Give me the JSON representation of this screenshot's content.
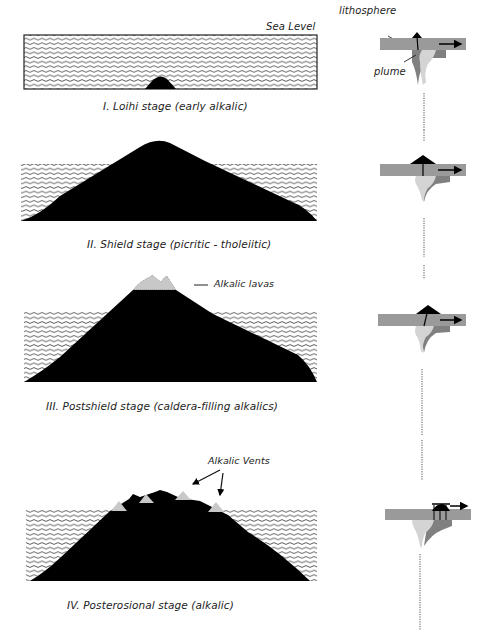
{
  "diagram": {
    "colors": {
      "volcano": "#000000",
      "alkalic": "#c8c8c8",
      "lithosphere": "#9a9a9a",
      "plume_light": "#d4d4d4",
      "plume_dark": "#808080",
      "water_line": "#333333"
    },
    "top_labels": {
      "sea_level": "Sea Level",
      "lithosphere": "lithosphere",
      "plume": "plume"
    },
    "stages": [
      {
        "id": "I",
        "caption": "I. Loihi stage (early alkalic)"
      },
      {
        "id": "II",
        "caption": "II. Shield stage (picritic - tholeiitic)"
      },
      {
        "id": "III",
        "caption": "III. Postshield stage (caldera-filling alkalics)",
        "annotation": "Alkalic lavas"
      },
      {
        "id": "IV",
        "caption": "IV. Posterosional stage (alkalic)",
        "annotation": "Alkalic Vents"
      }
    ]
  }
}
